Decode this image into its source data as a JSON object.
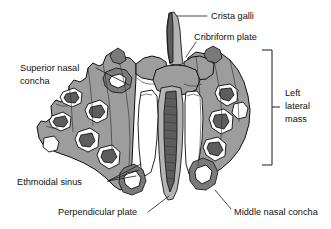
{
  "figure": {
    "background_color": "#ffffff",
    "bone_fill_color": "#9d9d9d",
    "outline_color": "#0d0d0d",
    "text_color": "#101010",
    "width": 331,
    "height": 229
  },
  "labels": {
    "crista_galli": "Crista galli",
    "cribriform_plate": "Cribriform plate",
    "superior_nasal_concha_line1": "Superior nasal",
    "superior_nasal_concha_line2": "concha",
    "left_lateral_mass_line1": "Left",
    "left_lateral_mass_line2": "lateral",
    "left_lateral_mass_line3": "mass",
    "ethmoidal_sinus": "Ethmoidal  sinus",
    "perpendicular_plate": "Perpendicular plate",
    "middle_nasal_concha": "Middle nasal concha"
  }
}
